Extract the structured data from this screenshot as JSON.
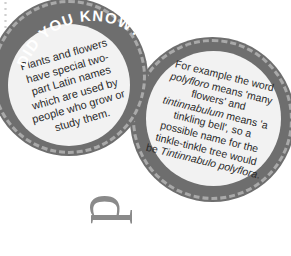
{
  "heading": "DID YOU KNOW?",
  "badge_left": {
    "text": "Plants and flowers have special two-part Latin names which are used by people who grow or study them."
  },
  "badge_right": {
    "text_parts": [
      "For example the word ",
      "polyfloro",
      " means 'many flowers' and ",
      "tintinnabulum",
      " means 'a tinkling bell', so a possible name for the tinkle-tinkle tree would be ",
      "Tintinnabulo polyflora",
      "."
    ]
  },
  "decor_letter": "p",
  "colors": {
    "ring": "#6e6e6e",
    "dash": "#a9a9a9",
    "fill": "#f2f2f2",
    "text": "#2a2a2a",
    "letter": "#8a8a8a"
  }
}
